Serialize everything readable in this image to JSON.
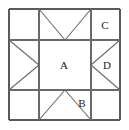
{
  "figure": {
    "pattern_name": "Variable Star block",
    "background_color": "#ffffff",
    "line_color": "#5a5a5a",
    "label_color": "#1a1a1a",
    "outer_border": {
      "x": 9,
      "y": 9,
      "width": 111,
      "height": 111
    },
    "grid": {
      "columns": [
        9,
        39,
        91,
        120
      ],
      "rows": [
        9,
        40,
        90,
        120
      ]
    }
  },
  "labels": [
    {
      "id": "label-a",
      "text": "A",
      "x": 64,
      "y": 65,
      "region": "center-square"
    },
    {
      "id": "label-b",
      "text": "B",
      "x": 82,
      "y": 103,
      "region": "bottom-middle-right-triangle"
    },
    {
      "id": "label-c",
      "text": "C",
      "x": 105,
      "y": 25,
      "region": "top-right-corner-square"
    },
    {
      "id": "label-d",
      "text": "D",
      "x": 107,
      "y": 65,
      "region": "right-middle-right-triangle"
    }
  ],
  "segments": {
    "border": [
      {
        "name": "outer-top",
        "x1": 9,
        "y1": 9,
        "x2": 120,
        "y2": 9
      },
      {
        "name": "outer-right",
        "x1": 120,
        "y1": 9,
        "x2": 120,
        "y2": 120
      },
      {
        "name": "outer-bottom",
        "x1": 9,
        "y1": 120,
        "x2": 120,
        "y2": 120
      },
      {
        "name": "outer-left",
        "x1": 9,
        "y1": 9,
        "x2": 9,
        "y2": 120
      }
    ],
    "grid": [
      {
        "name": "grid-horizontal-upper",
        "x1": 9,
        "y1": 40,
        "x2": 120,
        "y2": 40
      },
      {
        "name": "grid-horizontal-lower",
        "x1": 9,
        "y1": 90,
        "x2": 120,
        "y2": 90
      },
      {
        "name": "grid-vertical-left",
        "x1": 39,
        "y1": 9,
        "x2": 39,
        "y2": 120
      },
      {
        "name": "grid-vertical-right",
        "x1": 91,
        "y1": 9,
        "x2": 91,
        "y2": 120
      }
    ],
    "diagonals": [
      {
        "name": "top-v-left",
        "x1": 39,
        "y1": 9,
        "x2": 65,
        "y2": 40
      },
      {
        "name": "top-v-right",
        "x1": 91,
        "y1": 9,
        "x2": 65,
        "y2": 40
      },
      {
        "name": "bottom-caret-left",
        "x1": 39,
        "y1": 120,
        "x2": 65,
        "y2": 90
      },
      {
        "name": "bottom-caret-right",
        "x1": 91,
        "y1": 120,
        "x2": 65,
        "y2": 90
      },
      {
        "name": "left-chevron-top",
        "x1": 9,
        "y1": 40,
        "x2": 39,
        "y2": 65
      },
      {
        "name": "left-chevron-bottom",
        "x1": 9,
        "y1": 90,
        "x2": 39,
        "y2": 65
      },
      {
        "name": "right-chevron-top",
        "x1": 120,
        "y1": 40,
        "x2": 91,
        "y2": 65
      },
      {
        "name": "right-chevron-bottom",
        "x1": 120,
        "y1": 90,
        "x2": 91,
        "y2": 65
      }
    ]
  }
}
